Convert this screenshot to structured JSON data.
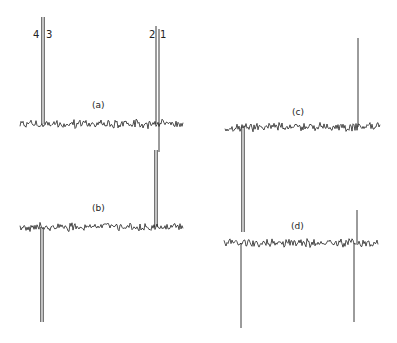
{
  "figure": {
    "background": "#ffffff",
    "ink": "#222222",
    "peak_labels": [
      {
        "text": "4",
        "x": 33,
        "y": 30
      },
      {
        "text": "3",
        "x": 46,
        "y": 30
      },
      {
        "text": "2",
        "x": 149,
        "y": 30
      },
      {
        "text": "1",
        "x": 160,
        "y": 30
      }
    ],
    "spectra": [
      {
        "label": "(a)",
        "label_x": 92,
        "label_y": 101,
        "baseline_y": 124,
        "x_start": 20,
        "x_end": 183,
        "seed": 11,
        "peaks": [
          {
            "x": 43,
            "top": 17,
            "bottom": 124,
            "double": true
          },
          {
            "x": 156,
            "top": 26,
            "bottom": 124,
            "double": false
          },
          {
            "x": 159,
            "top": 29,
            "bottom": 152,
            "double": false
          }
        ]
      },
      {
        "label": "(b)",
        "label_x": 92,
        "label_y": 204,
        "baseline_y": 227,
        "x_start": 20,
        "x_end": 183,
        "seed": 23,
        "peaks": [
          {
            "x": 156,
            "top": 150,
            "bottom": 227,
            "double": true
          },
          {
            "x": 42,
            "top": 227,
            "bottom": 322,
            "double": true
          }
        ]
      },
      {
        "label": "(c)",
        "label_x": 292,
        "label_y": 108,
        "baseline_y": 127,
        "x_start": 225,
        "x_end": 380,
        "seed": 37,
        "peaks": [
          {
            "x": 358,
            "top": 38,
            "bottom": 127,
            "double": false
          },
          {
            "x": 243,
            "top": 127,
            "bottom": 232,
            "double": true
          }
        ]
      },
      {
        "label": "(d)",
        "label_x": 291,
        "label_y": 222,
        "baseline_y": 243,
        "x_start": 224,
        "x_end": 378,
        "seed": 53,
        "peaks": [
          {
            "x": 357,
            "top": 210,
            "bottom": 243,
            "double": false
          },
          {
            "x": 354,
            "top": 243,
            "bottom": 322,
            "double": false
          },
          {
            "x": 241,
            "top": 243,
            "bottom": 328,
            "double": false
          }
        ]
      }
    ]
  }
}
